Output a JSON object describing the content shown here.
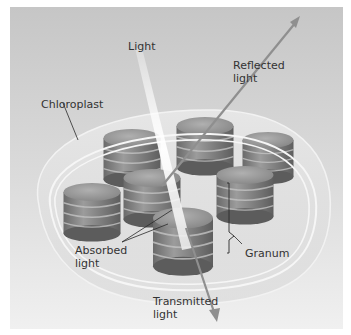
{
  "diagram": {
    "type": "biology-illustration",
    "labels": {
      "light": "Light",
      "reflected": "Reflected\nlight",
      "chloroplast": "Chloroplast",
      "absorbed": "Absorbed\nlight",
      "granum": "Granum",
      "transmitted": "Transmitted\nlight"
    },
    "colors": {
      "background_top": "#c9c9c9",
      "background_bottom": "#efefef",
      "envelope": "#e2e2e2",
      "membrane": "#f7f7f7",
      "granum_dark": "#6e6e6e",
      "granum_light": "#a8a8a8",
      "light_beam": "#f4f4f4",
      "arrow": "#8f8f8f",
      "leader_line": "#2a2a2a",
      "label_text": "#333333"
    }
  }
}
